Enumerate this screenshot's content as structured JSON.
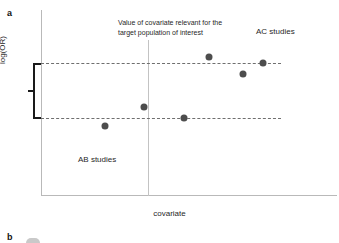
{
  "figure": {
    "panel_a_letter": "a",
    "panel_b_letter": "b"
  },
  "axes": {
    "y_label": "log(OR)",
    "x_label": "covariate"
  },
  "annotations": {
    "covariate_note": "Value of covariate relevant for the target population of interest",
    "ac_studies": "AC studies",
    "ab_studies": "AB studies"
  },
  "colors": {
    "point_fill": "#4d4d4d",
    "axis": "#b9b9b9",
    "dashed_line": "#6f6f6f",
    "bracket": "#1a1a1a",
    "reference_vline": "#c3c3c3",
    "text": "#1f1f1f",
    "background": "#ffffff"
  },
  "chart_data": {
    "type": "scatter",
    "title": "",
    "xlabel": "covariate",
    "ylabel": "log(OR)",
    "grid": false,
    "legend_position": "none",
    "axis_ticks": {
      "x": [],
      "y": []
    },
    "series": [
      {
        "name": "AB studies",
        "points": [
          {
            "x": 105,
            "y": 126
          },
          {
            "x": 144,
            "y": 107
          },
          {
            "x": 184,
            "y": 118
          }
        ]
      },
      {
        "name": "AC studies",
        "points": [
          {
            "x": 209,
            "y": 57
          },
          {
            "x": 243,
            "y": 74
          },
          {
            "x": 263,
            "y": 63
          }
        ]
      }
    ],
    "all_points": [
      {
        "x": 105,
        "y": 126
      },
      {
        "x": 144,
        "y": 107
      },
      {
        "x": 184,
        "y": 118
      },
      {
        "x": 209,
        "y": 57
      },
      {
        "x": 243,
        "y": 74
      },
      {
        "x": 263,
        "y": 63
      }
    ],
    "reference_lines": {
      "horizontal_dashed": [
        {
          "label": "upper",
          "y": 63
        },
        {
          "label": "lower",
          "y": 118
        }
      ],
      "vertical": [
        {
          "label": "target population covariate value",
          "x": 148
        }
      ]
    },
    "bracket": {
      "label": "range between reference lines",
      "y_top": 63,
      "y_bottom": 118
    }
  }
}
